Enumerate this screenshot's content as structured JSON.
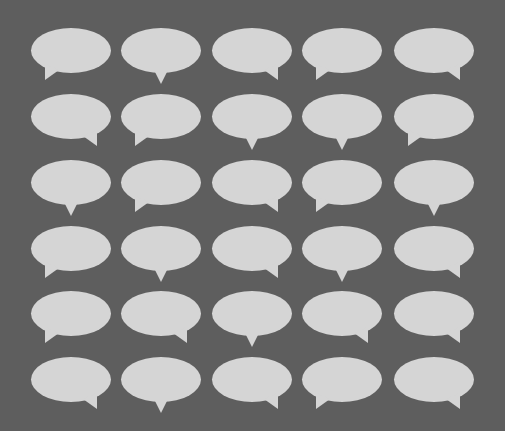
{
  "canvas": {
    "width": 505,
    "height": 431,
    "background": "#5e5e5e",
    "bubble_color": "#d5d5d5"
  },
  "grid": {
    "columns_x": [
      31,
      121,
      212,
      302,
      394
    ],
    "rows_y": [
      28,
      94,
      160,
      226,
      291,
      357
    ],
    "bubble_width": 80,
    "bubble_height": 45
  },
  "rows": [
    [
      "left",
      "center",
      "right",
      "left",
      "right"
    ],
    [
      "right",
      "left",
      "center",
      "center",
      "left"
    ],
    [
      "center",
      "left",
      "right",
      "left",
      "center"
    ],
    [
      "left",
      "center",
      "right",
      "center",
      "right"
    ],
    [
      "left",
      "right",
      "center",
      "right",
      "right"
    ],
    [
      "right",
      "center",
      "right",
      "left",
      "right"
    ]
  ]
}
